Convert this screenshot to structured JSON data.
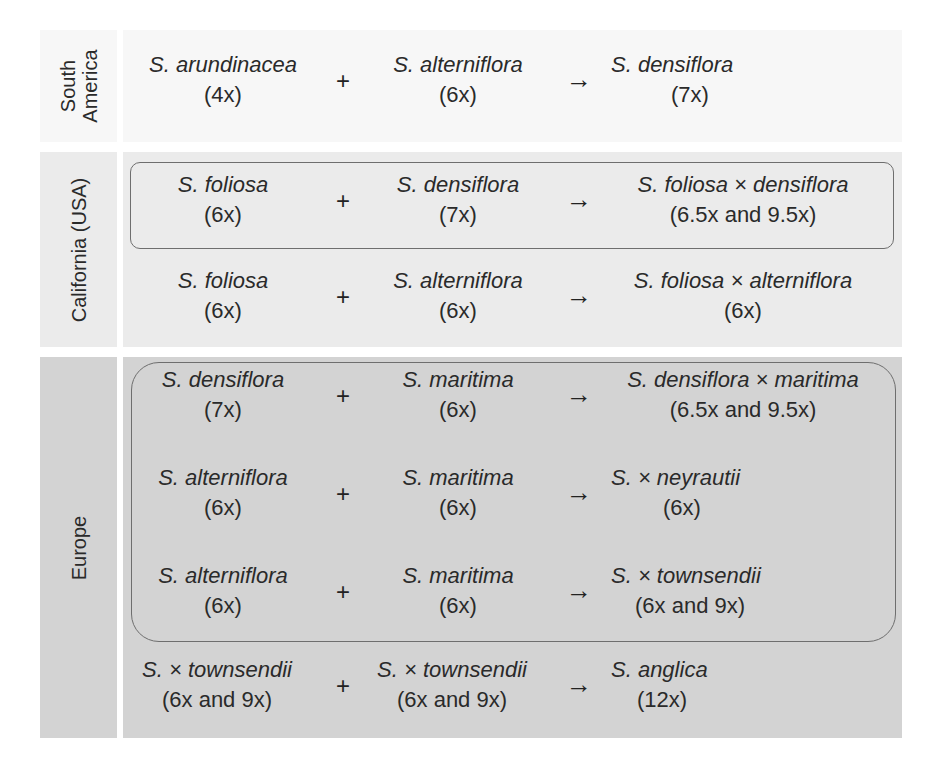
{
  "regions": [
    {
      "label": "South America",
      "label_lines": [
        "South",
        "America"
      ],
      "crosses": [
        {
          "parent1": {
            "name": "S. arundinacea",
            "ploidy": "(4x)"
          },
          "operator": "+",
          "parent2": {
            "name": "S. alterniflora",
            "ploidy": "(6x)"
          },
          "arrow": "→",
          "product": {
            "name": "S. densiflora",
            "ploidy": "(7x)"
          },
          "boxed": false
        }
      ]
    },
    {
      "label": "California (USA)",
      "crosses": [
        {
          "parent1": {
            "name": "S. foliosa",
            "ploidy": "(6x)"
          },
          "operator": "+",
          "parent2": {
            "name": "S. densiflora",
            "ploidy": "(7x)"
          },
          "arrow": "→",
          "product": {
            "name": "S. foliosa × densiflora",
            "ploidy": "(6.5x and 9.5x)"
          },
          "boxed": true
        },
        {
          "parent1": {
            "name": "S. foliosa",
            "ploidy": "(6x)"
          },
          "operator": "+",
          "parent2": {
            "name": "S. alterniflora",
            "ploidy": "(6x)"
          },
          "arrow": "→",
          "product": {
            "name": "S. foliosa × alterniflora",
            "ploidy": "(6x)"
          },
          "boxed": false
        }
      ]
    },
    {
      "label": "Europe",
      "crosses": [
        {
          "parent1": {
            "name": "S. densiflora",
            "ploidy": "(7x)"
          },
          "operator": "+",
          "parent2": {
            "name": "S. maritima",
            "ploidy": "(6x)"
          },
          "arrow": "→",
          "product": {
            "name": "S. densiflora × maritima",
            "ploidy": "(6.5x and 9.5x)"
          },
          "boxed": true
        },
        {
          "parent1": {
            "name": "S. alterniflora",
            "ploidy": "(6x)"
          },
          "operator": "+",
          "parent2": {
            "name": "S. maritima",
            "ploidy": "(6x)"
          },
          "arrow": "→",
          "product": {
            "name": "S. × neyrautii",
            "ploidy": "(6x)"
          },
          "boxed": true
        },
        {
          "parent1": {
            "name": "S. alterniflora",
            "ploidy": "(6x)"
          },
          "operator": "+",
          "parent2": {
            "name": "S. maritima",
            "ploidy": "(6x)"
          },
          "arrow": "→",
          "product": {
            "name": "S. × townsendii",
            "ploidy": "(6x and 9x)"
          },
          "boxed": true
        },
        {
          "parent1": {
            "name": "S. × townsendii",
            "ploidy": "(6x and 9x)"
          },
          "operator": "+",
          "parent2": {
            "name": "S. × townsendii",
            "ploidy": "(6x and 9x)"
          },
          "arrow": "→",
          "product": {
            "name": "S. anglica",
            "ploidy": "(12x)"
          },
          "boxed": false
        }
      ]
    }
  ],
  "colors": {
    "south_america_band": "#f7f7f7",
    "california_band": "#ebebeb",
    "europe_band": "#d3d3d3",
    "box_outline": "#6e6e6e",
    "text": "#2a2a2a"
  }
}
